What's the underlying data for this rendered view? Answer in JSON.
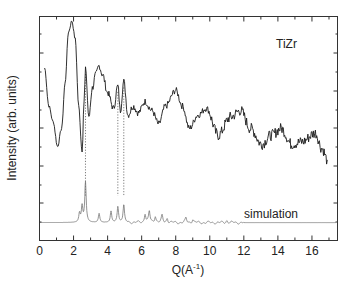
{
  "chart_data": {
    "type": "line",
    "title": "",
    "xlabel": "Q(A⁻¹)",
    "xlabel_base": "Q(A",
    "xlabel_sup": "-1",
    "xlabel_end": ")",
    "ylabel": "Intensity (arb. units)",
    "xlim": [
      0,
      17.5
    ],
    "ylim_hidden": true,
    "x_ticks": [
      0,
      2,
      4,
      6,
      8,
      10,
      12,
      14,
      16
    ],
    "x_tick_labels": [
      "0",
      "2",
      "4",
      "6",
      "8",
      "10",
      "12",
      "14",
      "16"
    ],
    "grid": false,
    "annotations": [
      "TiZr",
      "simulation"
    ],
    "reference_lines_Q": [
      2.7,
      4.6,
      4.95
    ],
    "series": [
      {
        "name": "TiZr",
        "style": "solid-noisy",
        "points_Q_relY": [
          [
            0.3,
            0.77
          ],
          [
            0.55,
            0.6
          ],
          [
            0.8,
            0.53
          ],
          [
            1.06,
            0.42
          ],
          [
            1.3,
            0.5
          ],
          [
            1.5,
            0.7
          ],
          [
            1.7,
            0.93
          ],
          [
            1.9,
            0.98
          ],
          [
            2.1,
            0.9
          ],
          [
            2.3,
            0.6
          ],
          [
            2.5,
            0.4
          ],
          [
            2.62,
            0.62
          ],
          [
            2.7,
            0.77
          ],
          [
            2.9,
            0.55
          ],
          [
            3.1,
            0.68
          ],
          [
            3.3,
            0.74
          ],
          [
            3.5,
            0.78
          ],
          [
            3.7,
            0.74
          ],
          [
            4.0,
            0.66
          ],
          [
            4.35,
            0.59
          ],
          [
            4.6,
            0.69
          ],
          [
            4.75,
            0.58
          ],
          [
            4.95,
            0.71
          ],
          [
            5.2,
            0.56
          ],
          [
            5.5,
            0.6
          ],
          [
            5.8,
            0.57
          ],
          [
            6.2,
            0.62
          ],
          [
            6.6,
            0.58
          ],
          [
            7.0,
            0.52
          ],
          [
            7.4,
            0.6
          ],
          [
            8.0,
            0.67
          ],
          [
            8.4,
            0.6
          ],
          [
            8.8,
            0.5
          ],
          [
            9.3,
            0.56
          ],
          [
            9.8,
            0.59
          ],
          [
            10.5,
            0.47
          ],
          [
            11.2,
            0.55
          ],
          [
            11.8,
            0.58
          ],
          [
            12.4,
            0.5
          ],
          [
            13.05,
            0.43
          ],
          [
            13.6,
            0.47
          ],
          [
            14.2,
            0.5
          ],
          [
            14.8,
            0.43
          ],
          [
            15.4,
            0.44
          ],
          [
            16.2,
            0.48
          ],
          [
            16.6,
            0.41
          ],
          [
            16.9,
            0.36
          ]
        ]
      },
      {
        "name": "simulation",
        "style": "solid-thin-gray",
        "baseline_relY": 0.08,
        "peaks_Q_height": [
          [
            2.35,
            0.04
          ],
          [
            2.5,
            0.07
          ],
          [
            2.7,
            0.18
          ],
          [
            3.5,
            0.04
          ],
          [
            4.2,
            0.05
          ],
          [
            4.6,
            0.07
          ],
          [
            4.95,
            0.08
          ],
          [
            6.2,
            0.04
          ],
          [
            6.45,
            0.05
          ],
          [
            6.8,
            0.03
          ],
          [
            7.2,
            0.03
          ],
          [
            7.5,
            0.02
          ],
          [
            8.6,
            0.02
          ],
          [
            9.0,
            0.015
          ],
          [
            11.0,
            0.01
          ]
        ]
      }
    ]
  }
}
